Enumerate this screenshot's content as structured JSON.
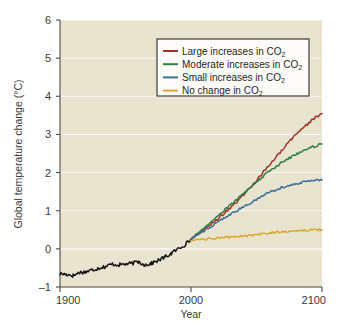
{
  "chart_data": {
    "type": "line",
    "title": "",
    "xlabel": "Year",
    "ylabel": "Global temperature change (°C)",
    "xlim": [
      1900,
      2100
    ],
    "ylim": [
      -1,
      6
    ],
    "xticks": [
      "1900",
      "2000",
      "2100"
    ],
    "yticks": [
      "-1",
      "0",
      "1",
      "2",
      "3",
      "4",
      "5",
      "6"
    ],
    "grid": "horizontal-white-gridlines",
    "legend_position": "upper-center-right",
    "background_plot": "#e9e4d0",
    "background_figure": "#ffffff",
    "x": [
      1900,
      1905,
      1910,
      1915,
      1920,
      1925,
      1930,
      1935,
      1940,
      1945,
      1950,
      1955,
      1960,
      1965,
      1970,
      1975,
      1980,
      1985,
      1990,
      1995,
      2000,
      2005,
      2010,
      2015,
      2020,
      2025,
      2030,
      2035,
      2040,
      2045,
      2050,
      2055,
      2060,
      2065,
      2070,
      2075,
      2080,
      2085,
      2090,
      2095,
      2100
    ],
    "series": [
      {
        "name": "Observed",
        "color": "#141414",
        "legend_shown": false,
        "x": [
          1900,
          1905,
          1910,
          1915,
          1920,
          1925,
          1930,
          1935,
          1940,
          1945,
          1950,
          1955,
          1960,
          1965,
          1970,
          1975,
          1980,
          1985,
          1990,
          1995,
          2000
        ],
        "values": [
          -0.65,
          -0.67,
          -0.7,
          -0.62,
          -0.6,
          -0.55,
          -0.5,
          -0.46,
          -0.4,
          -0.42,
          -0.4,
          -0.38,
          -0.34,
          -0.42,
          -0.38,
          -0.3,
          -0.22,
          -0.12,
          0.0,
          0.1,
          0.25
        ]
      },
      {
        "name": "Large increases in CO2",
        "label": "Large increases in CO",
        "label_sub": "2",
        "color": "#a03226",
        "legend_shown": true,
        "x": [
          2000,
          2005,
          2010,
          2015,
          2020,
          2025,
          2030,
          2035,
          2040,
          2045,
          2050,
          2055,
          2060,
          2065,
          2070,
          2075,
          2080,
          2085,
          2090,
          2095,
          2100
        ],
        "values": [
          0.25,
          0.38,
          0.5,
          0.64,
          0.78,
          0.93,
          1.08,
          1.24,
          1.42,
          1.6,
          1.8,
          2.0,
          2.2,
          2.4,
          2.6,
          2.8,
          3.0,
          3.15,
          3.3,
          3.45,
          3.55
        ]
      },
      {
        "name": "Moderate increases in CO2",
        "label": "Moderate increases in CO",
        "label_sub": "2",
        "color": "#2e7d45",
        "legend_shown": true,
        "x": [
          2000,
          2005,
          2010,
          2015,
          2020,
          2025,
          2030,
          2035,
          2040,
          2045,
          2050,
          2055,
          2060,
          2065,
          2070,
          2075,
          2080,
          2085,
          2090,
          2095,
          2100
        ],
        "values": [
          0.25,
          0.4,
          0.55,
          0.7,
          0.86,
          1.0,
          1.15,
          1.3,
          1.45,
          1.6,
          1.75,
          1.9,
          2.04,
          2.16,
          2.28,
          2.38,
          2.48,
          2.56,
          2.63,
          2.7,
          2.75
        ]
      },
      {
        "name": "Small increases in CO2",
        "label": "Small increases in CO",
        "label_sub": "2",
        "color": "#3f6e99",
        "legend_shown": true,
        "x": [
          2000,
          2005,
          2010,
          2015,
          2020,
          2025,
          2030,
          2035,
          2040,
          2045,
          2050,
          2055,
          2060,
          2065,
          2070,
          2075,
          2080,
          2085,
          2090,
          2095,
          2100
        ],
        "values": [
          0.25,
          0.36,
          0.47,
          0.58,
          0.7,
          0.8,
          0.9,
          1.0,
          1.1,
          1.2,
          1.3,
          1.4,
          1.48,
          1.55,
          1.62,
          1.67,
          1.71,
          1.74,
          1.77,
          1.79,
          1.8
        ]
      },
      {
        "name": "No change in CO2",
        "label": "No change in CO",
        "label_sub": "2",
        "color": "#d9a832",
        "legend_shown": true,
        "x": [
          2000,
          2005,
          2010,
          2015,
          2020,
          2025,
          2030,
          2035,
          2040,
          2045,
          2050,
          2055,
          2060,
          2065,
          2070,
          2075,
          2080,
          2085,
          2090,
          2095,
          2100
        ],
        "values": [
          0.22,
          0.24,
          0.25,
          0.27,
          0.28,
          0.3,
          0.31,
          0.32,
          0.34,
          0.35,
          0.37,
          0.4,
          0.42,
          0.44,
          0.45,
          0.46,
          0.47,
          0.48,
          0.49,
          0.5,
          0.5
        ]
      }
    ],
    "annotations": {
      "crossover": "Large increases curve rises above Moderate increases curve near 2050"
    }
  },
  "axes": {
    "y_title_main": "Global temperature change (",
    "y_title_unit": "°C",
    "y_title_close": ")",
    "x_title": "Year"
  },
  "legend": {
    "items": [
      {
        "label": "Large increases in CO",
        "sub": "2",
        "color": "#a03226"
      },
      {
        "label": "Moderate increases in CO",
        "sub": "2",
        "color": "#2e7d45"
      },
      {
        "label": "Small increases in CO",
        "sub": "2",
        "color": "#3f6e99"
      },
      {
        "label": "No change in CO",
        "sub": "2",
        "color": "#d9a832"
      }
    ]
  }
}
